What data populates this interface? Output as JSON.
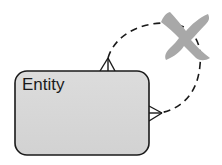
{
  "diagram": {
    "type": "er-recursive-relationship",
    "entity": {
      "label": "Entity",
      "fill": "#d6d6d6",
      "stroke": "#1a1a1a"
    },
    "relationship": {
      "style": "dashed",
      "cardinality_top": "many",
      "cardinality_right": "many",
      "crossed_out": true
    },
    "cross_mark": {
      "color": "#a8a8a8"
    }
  }
}
